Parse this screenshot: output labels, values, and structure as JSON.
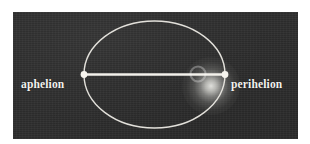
{
  "figure": {
    "name": "elliptical-orbit-diagram",
    "panel": {
      "background_color": "#2e2e2e",
      "page_background_color": "#ffffff"
    },
    "stroke_color": "#f2f2ee"
  },
  "labels": {
    "left": "aphelion",
    "right": "perihelion"
  },
  "diagram": {
    "ellipse": {
      "center_x": 154.5,
      "center_y": 74.5,
      "radius_x": 70.5,
      "radius_y": 53.5,
      "stroke_width": 1.4
    },
    "major_axis_line": {
      "x1": 84,
      "y1": 74.5,
      "x2": 225,
      "y2": 74.5,
      "stroke_width": 2.2
    },
    "vertices": [
      {
        "name": "aphelion-point",
        "x": 84,
        "y": 74.5,
        "radius": 3.4
      },
      {
        "name": "perihelion-point",
        "x": 225,
        "y": 74.5,
        "radius": 3.4
      }
    ],
    "sun": {
      "name": "sun-glow",
      "center_x": 198,
      "center_y": 74,
      "glow_radius": 29,
      "core_radius": 8
    }
  }
}
